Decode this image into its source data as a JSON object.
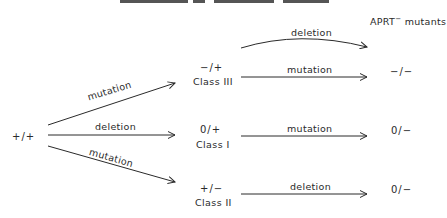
{
  "header": {
    "title": "APRT",
    "superscript": "−",
    "suffix": " mutants"
  },
  "start": {
    "genotype": "+/+"
  },
  "intermediates": [
    {
      "genotype": "−/+",
      "class_label": "Class III"
    },
    {
      "genotype": "0/+",
      "class_label": "Class I"
    },
    {
      "genotype": "+/−",
      "class_label": "Class II"
    }
  ],
  "first_step_arrows": [
    {
      "label": "mutation",
      "to": "Class III"
    },
    {
      "label": "deletion",
      "to": "Class I"
    },
    {
      "label": "mutation",
      "to": "Class II"
    }
  ],
  "second_step_arrows": [
    {
      "label": "deletion",
      "from": "Class III",
      "type": "curved"
    },
    {
      "label": "mutation",
      "from": "Class III"
    },
    {
      "label": "mutation",
      "from": "Class I"
    },
    {
      "label": "deletion",
      "from": "Class II"
    }
  ],
  "results": [
    {
      "genotype": "−/−"
    },
    {
      "genotype": "0/−"
    },
    {
      "genotype": "0/−"
    }
  ]
}
